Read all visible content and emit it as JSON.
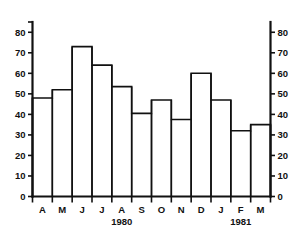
{
  "chart_data": {
    "type": "bar",
    "title": "",
    "subtitle": "",
    "xlabel": "",
    "ylabel": "",
    "categories": [
      "A",
      "M",
      "J",
      "J",
      "A",
      "S",
      "O",
      "N",
      "D",
      "J",
      "F",
      "M"
    ],
    "values": [
      48,
      52,
      73,
      64,
      53.5,
      40.5,
      47,
      37.5,
      60,
      47,
      32,
      35
    ],
    "ylim": [
      0,
      85
    ],
    "y_ticks": [
      0,
      10,
      20,
      30,
      40,
      50,
      60,
      70,
      80
    ],
    "y_tick_labels": [
      "0",
      "10",
      "20",
      "30",
      "40",
      "50",
      "60",
      "70",
      "80"
    ],
    "y_axis_both_sides": true,
    "grid": false,
    "legend": null,
    "bar_style": "outline",
    "annotations": [
      {
        "text": "1980",
        "under_category_index": 4
      },
      {
        "text": "1981",
        "under_category_index": 10
      }
    ],
    "colors": {
      "line": "#111111",
      "background": "#ffffff",
      "bar_fill": "#ffffff"
    }
  }
}
